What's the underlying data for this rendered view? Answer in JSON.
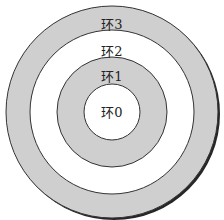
{
  "diagram": {
    "type": "concentric-rings",
    "center": [
      112,
      112
    ],
    "colors": {
      "shaded": "#cfcfcf",
      "white": "#ffffff",
      "stroke": "#333333"
    },
    "rings": [
      {
        "label": "环3",
        "radius": 106,
        "fill": "#cfcfcf",
        "label_y": 23
      },
      {
        "label": "环2",
        "radius": 82,
        "fill": "#ffffff",
        "label_y": 50
      },
      {
        "label": "环1",
        "radius": 55,
        "fill": "#cfcfcf",
        "label_y": 75
      },
      {
        "label": "环0",
        "radius": 28,
        "fill": "#ffffff",
        "label_y": 111
      }
    ]
  }
}
